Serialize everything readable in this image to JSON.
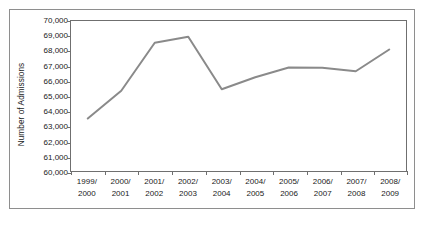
{
  "chart_data": {
    "type": "line",
    "title": "",
    "xlabel": "",
    "ylabel": "Number of Admissions",
    "categories": [
      "1999/\n2000",
      "2000/\n2001",
      "2001/\n2002",
      "2002/\n2003",
      "2003/\n2004",
      "2004/\n2005",
      "2005/\n2006",
      "2006/\n2007",
      "2007/\n2008",
      "2008/\n2009"
    ],
    "categories_split": [
      {
        "line1": "1999/",
        "line2": "2000"
      },
      {
        "line1": "2000/",
        "line2": "2001"
      },
      {
        "line1": "2001/",
        "line2": "2002"
      },
      {
        "line1": "2002/",
        "line2": "2003"
      },
      {
        "line1": "2003/",
        "line2": "2004"
      },
      {
        "line1": "2004/",
        "line2": "2005"
      },
      {
        "line1": "2005/",
        "line2": "2006"
      },
      {
        "line1": "2006/",
        "line2": "2007"
      },
      {
        "line1": "2007/",
        "line2": "2008"
      },
      {
        "line1": "2008/",
        "line2": "2009"
      }
    ],
    "values": [
      63500,
      65350,
      68550,
      68950,
      65450,
      66250,
      66900,
      66880,
      66650,
      68100
    ],
    "ylim": [
      60000,
      70000
    ],
    "ytick_values": [
      60000,
      61000,
      62000,
      63000,
      64000,
      65000,
      66000,
      67000,
      68000,
      69000,
      70000
    ],
    "ytick_labels": [
      "60,000",
      "61,000",
      "62,000",
      "63,000",
      "64,000",
      "65,000",
      "66,000",
      "67,000",
      "68,000",
      "69,000",
      "70,000"
    ],
    "grid": false,
    "legend": false,
    "legend_position": "none",
    "series": [
      {
        "name": "Number of Admissions",
        "color": "#8a8a8a",
        "values": [
          63500,
          65350,
          68550,
          68950,
          65450,
          66250,
          66900,
          66880,
          66650,
          68100
        ]
      }
    ]
  },
  "style": {
    "line_color": "#8a8a8a",
    "axis_color": "#6f6f6f",
    "frame_color": "#8e8e8e",
    "text_color": "#1a1a1a",
    "background": "#ffffff"
  }
}
